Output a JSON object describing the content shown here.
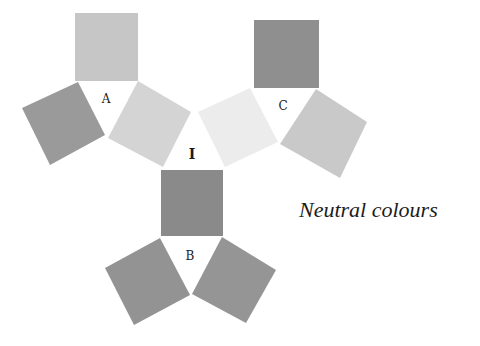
{
  "caption": "Neutral colours",
  "groups": [
    {
      "label": "A",
      "label_pos": [
        106,
        103
      ]
    },
    {
      "label": "I",
      "label_pos": [
        192,
        158
      ]
    },
    {
      "label": "C",
      "label_pos": [
        283,
        110
      ]
    },
    {
      "label": "B",
      "label_pos": [
        190,
        260
      ]
    }
  ],
  "swatches": [
    {
      "id": "a-top",
      "color": "#c6c6c6"
    },
    {
      "id": "a-left",
      "color": "#9a9a9a"
    },
    {
      "id": "a-right",
      "color": "#d4d4d4"
    },
    {
      "id": "i-light",
      "color": "#ececec"
    },
    {
      "id": "c-top",
      "color": "#8f8f8f"
    },
    {
      "id": "c-right",
      "color": "#c9c9c9"
    },
    {
      "id": "center",
      "color": "#8a8a8a"
    },
    {
      "id": "b-left",
      "color": "#939393"
    },
    {
      "id": "b-right",
      "color": "#959595"
    }
  ]
}
